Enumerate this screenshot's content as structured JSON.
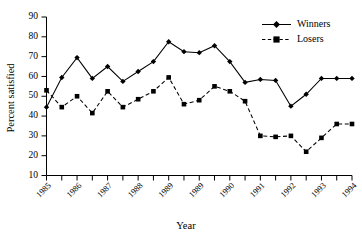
{
  "chart_data": {
    "type": "line",
    "title": "",
    "xlabel": "Year",
    "ylabel": "Percent satisfied",
    "ylim": [
      10,
      90
    ],
    "ytick_values": [
      10,
      20,
      30,
      40,
      50,
      60,
      70,
      80,
      90
    ],
    "ytick_labels": [
      "10",
      "20",
      "30",
      "40",
      "50",
      "60",
      "70",
      "80",
      "90"
    ],
    "xlim": [
      1985,
      1995
    ],
    "xtick_labels": [
      "1985",
      "1986",
      "1987",
      "1988",
      "1989",
      "1989",
      "1990",
      "1991",
      "1992",
      "1993",
      "1994",
      "1995"
    ],
    "x": [
      1985.0,
      1985.5,
      1986.0,
      1986.5,
      1987.0,
      1987.5,
      1988.0,
      1988.5,
      1989.0,
      1989.5,
      1990.0,
      1990.5,
      1991.0,
      1991.5,
      1992.0,
      1992.5,
      1993.0,
      1993.5,
      1994.0,
      1994.5,
      1995.0
    ],
    "grid": false,
    "legend_position": "top-right",
    "series": [
      {
        "name": "Winners",
        "marker": "diamond",
        "linestyle": "solid",
        "color": "#000000",
        "values": [
          44.5,
          59.5,
          69.5,
          59.0,
          65.0,
          57.5,
          62.5,
          67.5,
          77.5,
          72.5,
          72.0,
          75.5,
          67.5,
          57.0,
          58.5,
          58.0,
          45.0,
          51.0,
          59.0,
          59.0,
          59.0
        ]
      },
      {
        "name": "Losers",
        "marker": "square",
        "linestyle": "dashed",
        "color": "#000000",
        "values": [
          53.0,
          44.5,
          50.0,
          41.5,
          52.5,
          44.5,
          48.5,
          52.5,
          59.5,
          46.0,
          48.0,
          55.0,
          52.5,
          47.5,
          30.0,
          29.5,
          30.0,
          22.0,
          29.0,
          36.0,
          36.0
        ]
      }
    ]
  },
  "legend": {
    "entries": [
      {
        "label": "Winners"
      },
      {
        "label": "Losers"
      }
    ]
  }
}
